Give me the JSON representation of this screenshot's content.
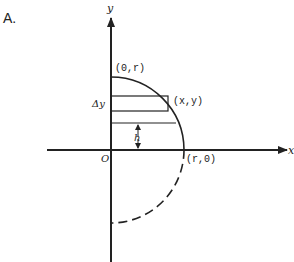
{
  "figure": {
    "panel_label": "A.",
    "axis_labels": {
      "x": "x",
      "y": "y"
    },
    "origin_label": "O",
    "points": {
      "top": "(0,r)",
      "right": "(r,0)",
      "on_curve": "(x,y)"
    },
    "strip_label": "Δy",
    "height_label": "h",
    "curve": {
      "upper_quadrant": "solid quarter circle",
      "lower_quadrant": "dashed quarter circle"
    },
    "colors": {
      "ink": "#222222",
      "background": "#ffffff"
    }
  }
}
